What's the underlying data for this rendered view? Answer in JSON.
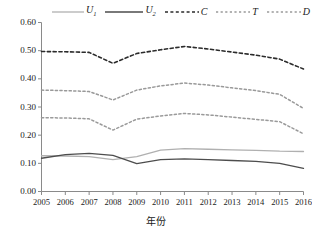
{
  "chart_data": {
    "type": "line",
    "title": "",
    "xlabel": "年份",
    "ylabel": "",
    "x": [
      2005,
      2006,
      2007,
      2008,
      2009,
      2010,
      2011,
      2012,
      2013,
      2014,
      2015,
      2016
    ],
    "categories": [
      "2005",
      "2006",
      "2007",
      "2008",
      "2009",
      "2010",
      "2011",
      "2012",
      "2013",
      "2014",
      "2015",
      "2016"
    ],
    "xlim": [
      2005,
      2016
    ],
    "ylim": [
      0.0,
      0.6
    ],
    "yticks": [
      0.0,
      0.1,
      0.2,
      0.3,
      0.4,
      0.5,
      0.6
    ],
    "ytick_labels": [
      "0.00",
      "0.10",
      "0.20",
      "0.30",
      "0.40",
      "0.50",
      "0.60"
    ],
    "grid": false,
    "legend_position": "top",
    "series": [
      {
        "name": "U1",
        "label": "U",
        "sub": "1",
        "style": "solid",
        "color": "#b0b0b0",
        "width": 1.3,
        "values": [
          0.127,
          0.126,
          0.124,
          0.113,
          0.124,
          0.147,
          0.152,
          0.15,
          0.148,
          0.146,
          0.143,
          0.142
        ]
      },
      {
        "name": "U2",
        "label": "U",
        "sub": "2",
        "style": "solid",
        "color": "#4d4d4d",
        "width": 1.3,
        "values": [
          0.118,
          0.131,
          0.135,
          0.128,
          0.099,
          0.113,
          0.116,
          0.113,
          0.11,
          0.107,
          0.1,
          0.082
        ]
      },
      {
        "name": "C",
        "label": "C",
        "sub": "",
        "style": "dashed",
        "color": "#2b2b2b",
        "width": 1.6,
        "values": [
          0.497,
          0.496,
          0.494,
          0.455,
          0.49,
          0.503,
          0.515,
          0.506,
          0.495,
          0.484,
          0.47,
          0.435
        ]
      },
      {
        "name": "T",
        "label": "T",
        "sub": "",
        "style": "dotted",
        "color": "#999999",
        "width": 1.5,
        "values": [
          0.36,
          0.358,
          0.355,
          0.325,
          0.36,
          0.375,
          0.385,
          0.378,
          0.368,
          0.358,
          0.345,
          0.295
        ]
      },
      {
        "name": "D",
        "label": "D",
        "sub": "",
        "style": "dotted",
        "color": "#9a9a9a",
        "width": 1.5,
        "values": [
          0.262,
          0.261,
          0.258,
          0.218,
          0.257,
          0.268,
          0.277,
          0.272,
          0.264,
          0.256,
          0.248,
          0.205
        ]
      }
    ]
  }
}
